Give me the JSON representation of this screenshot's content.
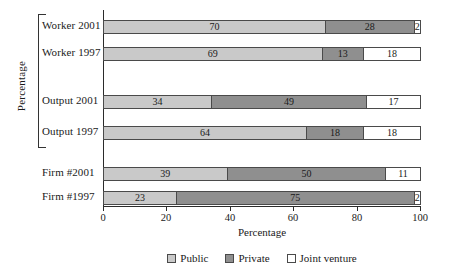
{
  "chart_data": {
    "type": "bar",
    "orientation": "horizontal",
    "stacked": true,
    "title": "",
    "xlabel": "Percentage",
    "ylabel": "Percentage",
    "xlim": [
      0,
      100
    ],
    "grid": false,
    "legend_position": "bottom",
    "xticks": [
      "0",
      "20",
      "40",
      "60",
      "80",
      "100"
    ],
    "xtick_values": [
      0,
      20,
      40,
      60,
      80,
      100
    ],
    "categories": [
      "Worker 2001",
      "Worker 1997",
      "Output 2001",
      "Output 1997",
      "Firm  #2001",
      "Firm  #1997"
    ],
    "series": [
      {
        "name": "Public",
        "color": "#c9c9c9",
        "values": [
          70,
          69,
          34,
          64,
          39,
          23
        ]
      },
      {
        "name": "Private",
        "color": "#8f8f8f",
        "values": [
          28,
          13,
          49,
          18,
          50,
          75
        ]
      },
      {
        "name": "Joint venture",
        "color": "#ffffff",
        "values": [
          2,
          18,
          17,
          18,
          11,
          2
        ]
      }
    ],
    "rows": [
      {
        "label": "Worker 2001",
        "segments": [
          {
            "series": "Public",
            "value": 70,
            "label": "70"
          },
          {
            "series": "Private",
            "value": 28,
            "label": "28"
          },
          {
            "series": "Joint venture",
            "value": 2,
            "label": "2"
          }
        ]
      },
      {
        "label": "Worker 1997",
        "segments": [
          {
            "series": "Public",
            "value": 69,
            "label": "69"
          },
          {
            "series": "Private",
            "value": 13,
            "label": "13"
          },
          {
            "series": "Joint venture",
            "value": 18,
            "label": "18"
          }
        ]
      },
      {
        "label": "Output 2001",
        "segments": [
          {
            "series": "Public",
            "value": 34,
            "label": "34"
          },
          {
            "series": "Private",
            "value": 49,
            "label": "49"
          },
          {
            "series": "Joint venture",
            "value": 17,
            "label": "17"
          }
        ]
      },
      {
        "label": "Output 1997",
        "segments": [
          {
            "series": "Public",
            "value": 64,
            "label": "64"
          },
          {
            "series": "Private",
            "value": 18,
            "label": "18"
          },
          {
            "series": "Joint venture",
            "value": 18,
            "label": "18"
          }
        ]
      },
      {
        "label": "Firm  #2001",
        "segments": [
          {
            "series": "Public",
            "value": 39,
            "label": "39"
          },
          {
            "series": "Private",
            "value": 50,
            "label": "50"
          },
          {
            "series": "Joint venture",
            "value": 11,
            "label": "11"
          }
        ]
      },
      {
        "label": "Firm  #1997",
        "segments": [
          {
            "series": "Public",
            "value": 23,
            "label": "23"
          },
          {
            "series": "Private",
            "value": 75,
            "label": "75"
          },
          {
            "series": "Joint venture",
            "value": 2,
            "label": "2"
          }
        ]
      }
    ]
  },
  "axes": {
    "ylabel": "Percentage",
    "xlabel": "Percentage",
    "xticks": [
      {
        "label": "0",
        "value": 0
      },
      {
        "label": "20",
        "value": 20
      },
      {
        "label": "40",
        "value": 40
      },
      {
        "label": "60",
        "value": 60
      },
      {
        "label": "80",
        "value": 80
      },
      {
        "label": "100",
        "value": 100
      }
    ]
  },
  "legend": {
    "items": [
      {
        "label": "Public",
        "color": "#c9c9c9"
      },
      {
        "label": "Private",
        "color": "#8f8f8f"
      },
      {
        "label": "Joint venture",
        "color": "#ffffff"
      }
    ]
  },
  "category_labels": [
    "Worker 2001",
    "Worker 1997",
    "Output 2001",
    "Output 1997",
    "Firm  #2001",
    "Firm  #1997"
  ]
}
